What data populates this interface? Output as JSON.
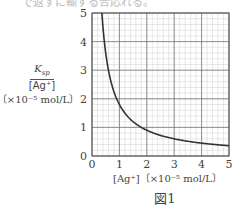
{
  "top_text": "で返すに輸ずる合応れる。",
  "figure": {
    "caption": "図1",
    "ylabel_numerator": "K",
    "ylabel_numerator_sub": "sp",
    "ylabel_denominator": "[Ag⁺]",
    "ylabel_unit": "〔×10⁻⁵ mol/L〕",
    "xlabel": "[Ag⁺]〔×10⁻⁵ mol/L〕"
  },
  "chart_data": {
    "type": "line",
    "title": "図1",
    "xlabel": "[Ag⁺] [×10⁻⁵ mol/L]",
    "ylabel": "Ksp/[Ag⁺] [×10⁻⁵ mol/L]",
    "xlim": [
      0,
      5
    ],
    "ylim": [
      0,
      5
    ],
    "x_ticks": [
      0,
      1,
      2,
      3,
      4,
      5
    ],
    "y_ticks": [
      0,
      1,
      2,
      3,
      4,
      5
    ],
    "grid": true,
    "minor_grid_step": 0.2,
    "series": [
      {
        "name": "Ksp/[Ag+] vs [Ag+]",
        "x": [
          0.36,
          0.4,
          0.5,
          0.6,
          0.8,
          1.0,
          1.2,
          1.5,
          2.0,
          2.5,
          3.0,
          3.5,
          4.0,
          4.5,
          5.0
        ],
        "y": [
          5.0,
          4.5,
          3.6,
          3.0,
          2.25,
          1.8,
          1.5,
          1.2,
          0.9,
          0.72,
          0.6,
          0.51,
          0.45,
          0.4,
          0.36
        ]
      }
    ],
    "colors": {
      "curve": "#333333",
      "major_grid": "#777777",
      "minor_grid": "#cfcfcf",
      "axis": "#555555"
    }
  }
}
